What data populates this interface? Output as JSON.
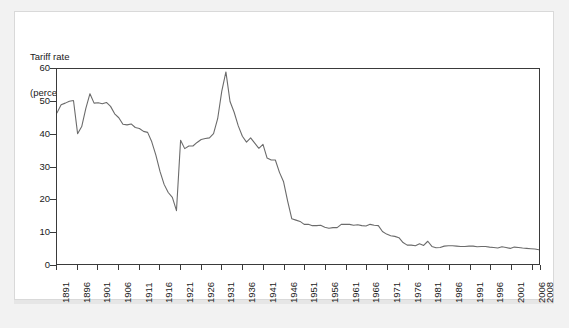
{
  "figure": {
    "background_color": "#f2f2f2",
    "panel_color": "#ffffff",
    "axis_color": "#3a3a3a",
    "line_color": "#6b6b6b"
  },
  "chart_data": {
    "type": "line",
    "title": "",
    "subtitle": "",
    "ylabel_line1": "Tariff rate",
    "ylabel_line2": "(percent)",
    "xlabel": "",
    "ylim": [
      0,
      60
    ],
    "xlim": [
      1891,
      2008
    ],
    "grid": false,
    "legend": null,
    "legend_position": "none",
    "y_ticks": [
      0,
      10,
      20,
      30,
      40,
      50,
      60
    ],
    "y_tick_labels": [
      "0",
      "10",
      "20",
      "30",
      "40",
      "50",
      "60"
    ],
    "x_ticks": [
      1891,
      1896,
      1901,
      1906,
      1911,
      1916,
      1921,
      1926,
      1931,
      1936,
      1941,
      1946,
      1951,
      1956,
      1961,
      1966,
      1971,
      1976,
      1981,
      1986,
      1991,
      1996,
      2001,
      2006,
      2008
    ],
    "x_tick_labels": [
      "1891",
      "1896",
      "1901",
      "1906",
      "1911",
      "1916",
      "1921",
      "1926",
      "1931",
      "1936",
      "1941",
      "1946",
      "1951",
      "1956",
      "1961",
      "1966",
      "1971",
      "1976",
      "1981",
      "1986",
      "1991",
      "1996",
      "2001",
      "2006",
      "2008"
    ],
    "series": [
      {
        "name": "Tariff rate",
        "x": [
          1891,
          1892,
          1893,
          1894,
          1895,
          1896,
          1897,
          1898,
          1899,
          1900,
          1901,
          1902,
          1903,
          1904,
          1905,
          1906,
          1907,
          1908,
          1909,
          1910,
          1911,
          1912,
          1913,
          1914,
          1915,
          1916,
          1917,
          1918,
          1919,
          1920,
          1921,
          1922,
          1923,
          1924,
          1925,
          1926,
          1927,
          1928,
          1929,
          1930,
          1931,
          1932,
          1933,
          1934,
          1935,
          1936,
          1937,
          1938,
          1939,
          1940,
          1941,
          1942,
          1943,
          1944,
          1945,
          1946,
          1947,
          1948,
          1949,
          1950,
          1951,
          1952,
          1953,
          1954,
          1955,
          1956,
          1957,
          1958,
          1959,
          1960,
          1961,
          1962,
          1963,
          1964,
          1965,
          1966,
          1967,
          1968,
          1969,
          1970,
          1971,
          1972,
          1973,
          1974,
          1975,
          1976,
          1977,
          1978,
          1979,
          1980,
          1981,
          1982,
          1983,
          1984,
          1985,
          1986,
          1987,
          1988,
          1989,
          1990,
          1991,
          1992,
          1993,
          1994,
          1995,
          1996,
          1997,
          1998,
          1999,
          2000,
          2001,
          2002,
          2003,
          2004,
          2005,
          2006,
          2007,
          2008
        ],
        "values": [
          46.5,
          49.0,
          49.5,
          50.1,
          50.3,
          40.1,
          42.3,
          47.9,
          52.4,
          49.5,
          49.6,
          49.3,
          49.7,
          48.5,
          46.2,
          45.0,
          43.0,
          42.8,
          43.1,
          42.0,
          41.7,
          40.8,
          40.5,
          37.6,
          33.5,
          28.5,
          24.5,
          22.0,
          20.5,
          16.4,
          38.1,
          35.5,
          36.3,
          36.3,
          37.4,
          38.3,
          38.6,
          38.8,
          40.1,
          44.7,
          53.2,
          59.1,
          50.0,
          46.7,
          42.5,
          39.3,
          37.5,
          38.8,
          37.2,
          35.6,
          36.8,
          32.6,
          32.0,
          32.0,
          28.2,
          25.3,
          19.3,
          13.9,
          13.5,
          13.1,
          12.2,
          12.2,
          11.8,
          11.8,
          11.9,
          11.3,
          11.0,
          11.2,
          11.2,
          12.2,
          12.2,
          12.2,
          11.9,
          12.1,
          11.8,
          11.7,
          12.2,
          11.9,
          11.8,
          10.0,
          9.2,
          8.7,
          8.5,
          8.1,
          6.6,
          5.8,
          5.8,
          5.6,
          6.2,
          5.7,
          7.0,
          5.4,
          5.0,
          5.1,
          5.5,
          5.6,
          5.6,
          5.5,
          5.4,
          5.4,
          5.5,
          5.5,
          5.3,
          5.4,
          5.4,
          5.2,
          5.1,
          4.9,
          5.3,
          5.1,
          4.8,
          5.2,
          5.1,
          4.9,
          4.8,
          4.7,
          4.6,
          4.4
        ]
      }
    ]
  }
}
